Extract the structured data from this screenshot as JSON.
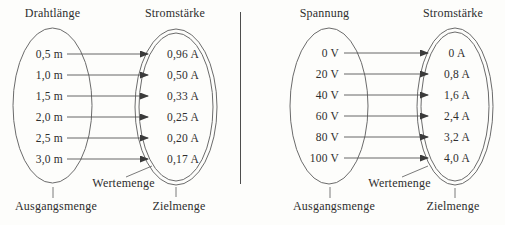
{
  "left_diagram": {
    "domain_title": "Drahtlänge",
    "codomain_title": "Stromstärke",
    "pairs": [
      {
        "input": "0,5 m",
        "output": "0,96 A"
      },
      {
        "input": "1,0 m",
        "output": "0,50 A"
      },
      {
        "input": "1,5 m",
        "output": "0,33 A"
      },
      {
        "input": "2,0 m",
        "output": "0,25 A"
      },
      {
        "input": "2,5 m",
        "output": "0,20 A"
      },
      {
        "input": "3,0 m",
        "output": "0,17 A"
      }
    ],
    "labels": {
      "domain_set": "Ausgangsmenge",
      "value_set": "Wertemenge",
      "target_set": "Zielmenge"
    }
  },
  "right_diagram": {
    "domain_title": "Spannung",
    "codomain_title": "Stromstärke",
    "pairs": [
      {
        "input": "0 V",
        "output": "0 A"
      },
      {
        "input": "20 V",
        "output": "0,8 A"
      },
      {
        "input": "40 V",
        "output": "1,6 A"
      },
      {
        "input": "60 V",
        "output": "2,4 A"
      },
      {
        "input": "80 V",
        "output": "3,2 A"
      },
      {
        "input": "100 V",
        "output": "4,0 A"
      }
    ],
    "labels": {
      "domain_set": "Ausgangsmenge",
      "value_set": "Wertemenge",
      "target_set": "Zielmenge"
    }
  },
  "colors": {
    "ink": "#2e2e2e",
    "stroke": "#666666",
    "arrow": "#3a3a3a",
    "paper": "#fdfdfb"
  }
}
